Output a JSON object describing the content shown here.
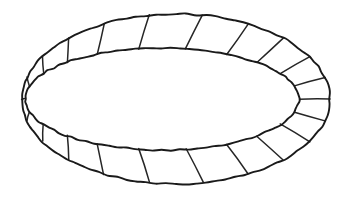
{
  "figure": {
    "background_color": "#ffffff",
    "stroke_color": "#1a1a1a",
    "rung_color": "#262626",
    "stroke_width": 1.9,
    "rung_width": 1.5,
    "canvas": {
      "width": 345,
      "height": 197
    },
    "outer_ellipse": {
      "name": "outer-ellipse",
      "cx": 176,
      "cy": 99,
      "rx": 154,
      "ry": 85,
      "rotation_deg": 0
    },
    "inner_ellipse": {
      "name": "inner-ellipse",
      "cx": 162,
      "cy": 99,
      "rx": 137,
      "ry": 51,
      "rotation_deg": 0
    },
    "segment_count": 24,
    "rung_angles_deg": [
      0,
      15,
      30,
      46,
      62,
      80,
      100,
      118,
      134,
      150,
      165,
      180,
      195,
      210,
      226,
      242,
      260,
      280,
      298,
      314,
      330,
      345
    ]
  },
  "chart_data": {
    "type": "diagram",
    "shape": "annulus-band",
    "segments": 24,
    "outer_rx": 154,
    "outer_ry": 85,
    "inner_rx": 137,
    "inner_ry": 51
  }
}
